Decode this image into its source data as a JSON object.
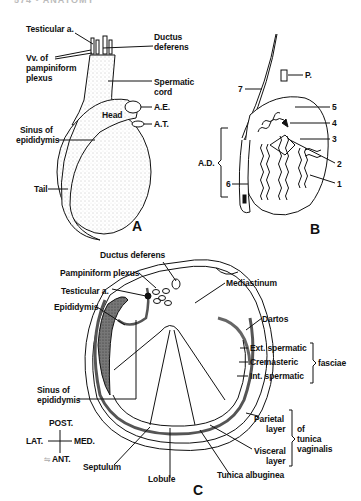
{
  "header": {
    "text": "574 • ANATOMY"
  },
  "panelA": {
    "letter": "A",
    "labels": {
      "testicular_a": "Testicular a.",
      "vv_plexus_1": "Vv. of",
      "vv_plexus_2": "pampiniform",
      "vv_plexus_3": "plexus",
      "ductus_1": "Ductus",
      "ductus_2": "deferens",
      "cord_1": "Spermatic",
      "cord_2": "cord",
      "ae": "A.E.",
      "head": "Head",
      "at": "A.T.",
      "sinus_1": "Sinus of",
      "sinus_2": "epididymis",
      "tail": "Tail"
    }
  },
  "panelB": {
    "letter": "B",
    "labels": {
      "p": "P.",
      "n7": "7",
      "n5": "5",
      "n4": "4",
      "n3": "3",
      "n2": "2",
      "n1": "1",
      "n6": "6",
      "ad": "A.D."
    }
  },
  "panelC": {
    "letter": "C",
    "labels": {
      "ductus": "Ductus deferens",
      "plexus": "Pampiniform plexus",
      "testicular": "Testicular a.",
      "epididymis": "Epididymis",
      "mediastinum": "Mediastinum",
      "dartos": "Dartos",
      "ext": "Ext. spermatic",
      "crem": "Cremasteric",
      "int": "Int. spermatic",
      "fasciae": "fasciae",
      "sinus_1": "Sinus of",
      "sinus_2": "epididymis",
      "post": "POST.",
      "lat": "LAT.",
      "med": "MED.",
      "ant": "ANT.",
      "parietal_1": "Parietal",
      "parietal_2": "layer",
      "visceral_1": "Visceral",
      "visceral_2": "layer",
      "of": "of",
      "tunica": "tunica",
      "vaginalis": "vaginalis",
      "septulum": "Septulum",
      "lobule": "Lobule",
      "albuginea": "Tunica albuginea"
    }
  }
}
